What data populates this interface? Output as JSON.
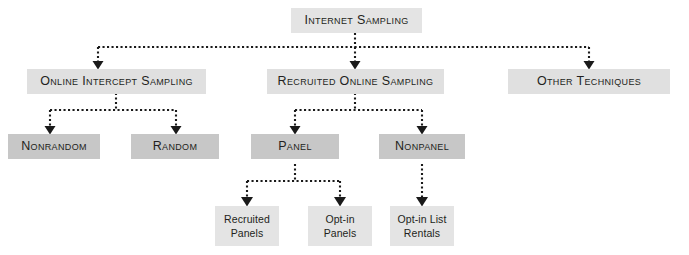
{
  "diagram": {
    "title": "Internet Sampling",
    "type": "hierarchy-tree",
    "colors": {
      "light_box": "#e4e4e4",
      "medium_box": "#c7c7c7",
      "text": "#231f20",
      "connector": "#1a1a1a",
      "background": "#ffffff"
    },
    "levels": [
      {
        "level": 1,
        "nodes": [
          {
            "id": "internet-sampling",
            "label": "Internet Sampling",
            "style": "light",
            "case": "small-caps"
          }
        ]
      },
      {
        "level": 2,
        "nodes": [
          {
            "id": "online-intercept-sampling",
            "label": "Online Intercept Sampling",
            "style": "light",
            "case": "small-caps"
          },
          {
            "id": "recruited-online-sampling",
            "label": "Recruited Online Sampling",
            "style": "light",
            "case": "small-caps"
          },
          {
            "id": "other-techniques",
            "label": "Other Techniques",
            "style": "light",
            "case": "small-caps"
          }
        ]
      },
      {
        "level": 3,
        "nodes": [
          {
            "id": "nonrandom",
            "label": "Nonrandom",
            "style": "medium",
            "case": "small-caps"
          },
          {
            "id": "random",
            "label": "Random",
            "style": "medium",
            "case": "small-caps"
          },
          {
            "id": "panel",
            "label": "Panel",
            "style": "medium",
            "case": "small-caps"
          },
          {
            "id": "nonpanel",
            "label": "Nonpanel",
            "style": "medium",
            "case": "small-caps"
          }
        ]
      },
      {
        "level": 4,
        "nodes": [
          {
            "id": "recruited-panels",
            "label": "Recruited Panels",
            "style": "light",
            "case": "mixed"
          },
          {
            "id": "opt-in-panels",
            "label": "Opt-in Panels",
            "style": "light",
            "case": "mixed"
          },
          {
            "id": "opt-in-list-rentals",
            "label": "Opt-in List Rentals",
            "style": "light",
            "case": "mixed"
          }
        ]
      }
    ],
    "edges": [
      {
        "from": "internet-sampling",
        "to": "online-intercept-sampling",
        "style": "dotted",
        "arrow": "triangle-down"
      },
      {
        "from": "internet-sampling",
        "to": "recruited-online-sampling",
        "style": "dotted",
        "arrow": "triangle-down"
      },
      {
        "from": "internet-sampling",
        "to": "other-techniques",
        "style": "dotted",
        "arrow": "triangle-down"
      },
      {
        "from": "online-intercept-sampling",
        "to": "nonrandom",
        "style": "dotted",
        "arrow": "triangle-down"
      },
      {
        "from": "online-intercept-sampling",
        "to": "random",
        "style": "dotted",
        "arrow": "triangle-down"
      },
      {
        "from": "recruited-online-sampling",
        "to": "panel",
        "style": "dotted",
        "arrow": "triangle-down"
      },
      {
        "from": "recruited-online-sampling",
        "to": "nonpanel",
        "style": "dotted",
        "arrow": "triangle-down"
      },
      {
        "from": "panel",
        "to": "recruited-panels",
        "style": "dotted",
        "arrow": "triangle-down"
      },
      {
        "from": "panel",
        "to": "opt-in-panels",
        "style": "dotted",
        "arrow": "triangle-down"
      },
      {
        "from": "nonpanel",
        "to": "opt-in-list-rentals",
        "style": "dotted",
        "arrow": "triangle-down"
      }
    ]
  }
}
